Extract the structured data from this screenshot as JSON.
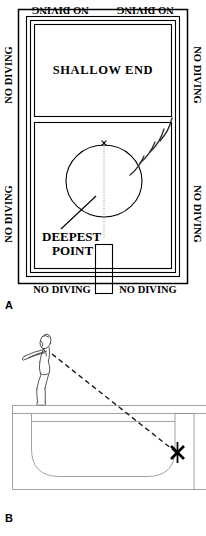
{
  "figure": {
    "panels": [
      {
        "id": "A",
        "label": "A",
        "type": "pool-overhead-plan-view",
        "zone_label": "SHALLOW END",
        "deepest_point_label_line1": "DEEPEST",
        "deepest_point_label_line2": "POINT",
        "target_marker": "x",
        "warning_text": "NO DIVING",
        "signs": [
          {
            "position": "top-left",
            "text": "NO DIVING",
            "orientation": "rotated-180"
          },
          {
            "position": "top-right",
            "text": "NO DIVING",
            "orientation": "rotated-180"
          },
          {
            "position": "left-upper",
            "text": "NO DIVING",
            "orientation": "rotated-270"
          },
          {
            "position": "left-lower",
            "text": "NO DIVING",
            "orientation": "rotated-270"
          },
          {
            "position": "right-upper",
            "text": "NO DIVING",
            "orientation": "rotated-90"
          },
          {
            "position": "right-lower",
            "text": "NO DIVING",
            "orientation": "rotated-90"
          },
          {
            "position": "bottom-left",
            "text": "NO DIVING",
            "orientation": "upright"
          },
          {
            "position": "bottom-right",
            "text": "NO DIVING",
            "orientation": "upright"
          }
        ]
      },
      {
        "id": "B",
        "label": "B",
        "type": "pool-cross-section-side-view",
        "diver": "diver-figure-on-deck",
        "trajectory": "dashed-dive-path",
        "target_marker": "x"
      }
    ],
    "caption": ""
  },
  "colors": {
    "ink": "#000000",
    "line": "#2a2a2a",
    "gray_line": "#8a8a8a",
    "background": "#ffffff"
  }
}
